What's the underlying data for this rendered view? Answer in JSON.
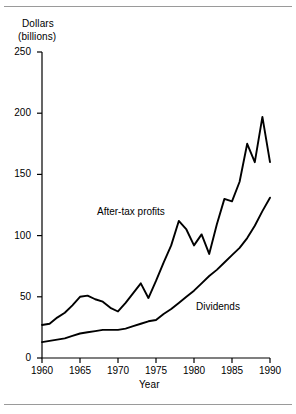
{
  "figure": {
    "background": "#ffffff",
    "line_color": "#000000",
    "rule_color": "#9a9a9a",
    "top_rule": true,
    "bottom_rule": true
  },
  "chart_data": {
    "type": "line",
    "title": "",
    "subtitle": "",
    "ylabel_lines": [
      "Dollars",
      "(billions)"
    ],
    "ylabel": "Dollars (billions)",
    "xlabel": "Year",
    "xlim": [
      1960,
      1990
    ],
    "ylim": [
      0,
      250
    ],
    "yticks": [
      0,
      50,
      100,
      150,
      200,
      250
    ],
    "ytick_labels": [
      "0",
      "50",
      "100",
      "150",
      "200",
      "250"
    ],
    "xticks": [
      1960,
      1965,
      1970,
      1975,
      1980,
      1985,
      1990
    ],
    "xtick_labels": [
      "1960",
      "1965",
      "1970",
      "1975",
      "1980",
      "1985",
      "1990"
    ],
    "grid": false,
    "legend_position": "inline-annotation",
    "annotations": [
      {
        "text": "After-tax profits",
        "x": 1968,
        "y": 127
      },
      {
        "text": "Dividends",
        "x": 1981,
        "y": 49
      }
    ],
    "x": [
      1960,
      1961,
      1962,
      1963,
      1964,
      1965,
      1966,
      1967,
      1968,
      1969,
      1970,
      1971,
      1972,
      1973,
      1974,
      1975,
      1976,
      1977,
      1978,
      1979,
      1980,
      1981,
      1982,
      1983,
      1984,
      1985,
      1986,
      1987,
      1988,
      1989,
      1990
    ],
    "series": [
      {
        "name": "After-tax profits",
        "values": [
          27,
          28,
          33,
          37,
          43,
          50,
          51,
          48,
          46,
          41,
          38,
          45,
          53,
          61,
          49,
          63,
          78,
          92,
          112,
          105,
          92,
          101,
          85,
          109,
          130,
          128,
          144,
          175,
          160,
          197,
          160
        ]
      },
      {
        "name": "Dividends",
        "values": [
          13,
          14,
          15,
          16,
          18,
          20,
          21,
          22,
          23,
          23,
          23,
          24,
          26,
          28,
          30,
          31,
          36,
          40,
          45,
          50,
          55,
          61,
          67,
          72,
          78,
          84,
          90,
          98,
          108,
          120,
          131
        ]
      }
    ]
  }
}
